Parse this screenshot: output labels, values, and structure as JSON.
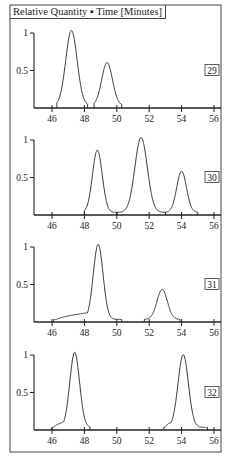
{
  "header": {
    "title": "Relative Quantity ▪ Time [Minutes]"
  },
  "chart_data": [
    {
      "type": "line",
      "title": "Relative Quantity vs Time [Minutes]",
      "panel_label": "29",
      "xlabel": "Time [Minutes]",
      "ylabel": "Relative Quantity",
      "xlim": [
        45,
        56.2
      ],
      "ylim": [
        0,
        1
      ],
      "xticks": [
        46,
        48,
        50,
        52,
        54,
        56
      ],
      "yticks": [
        0.5,
        1
      ],
      "grid": false,
      "peaks": [
        {
          "center": 47.2,
          "height": 1.0,
          "width": 0.35,
          "start": 46.3,
          "end": 48.2
        },
        {
          "center": 49.4,
          "height": 0.57,
          "width": 0.33,
          "start": 48.6,
          "end": 50.3
        }
      ]
    },
    {
      "type": "line",
      "title": "Relative Quantity vs Time [Minutes]",
      "panel_label": "30",
      "xlabel": "Time [Minutes]",
      "ylabel": "Relative Quantity",
      "xlim": [
        45,
        56.2
      ],
      "ylim": [
        0,
        1
      ],
      "xticks": [
        46,
        48,
        50,
        52,
        54,
        56
      ],
      "yticks": [
        0.5,
        1
      ],
      "grid": false,
      "peaks": [
        {
          "center": 48.8,
          "height": 0.83,
          "width": 0.3,
          "start": 48.0,
          "end": 50.0
        },
        {
          "center": 51.5,
          "height": 1.0,
          "width": 0.38,
          "start": 50.0,
          "end": 53.0
        },
        {
          "center": 54.0,
          "height": 0.55,
          "width": 0.3,
          "start": 53.0,
          "end": 55.0
        }
      ],
      "baseline_markers": [
        48.0,
        50.0,
        53.0
      ]
    },
    {
      "type": "line",
      "title": "Relative Quantity vs Time [Minutes]",
      "panel_label": "31",
      "xlabel": "Time [Minutes]",
      "ylabel": "Relative Quantity",
      "xlim": [
        45,
        56.2
      ],
      "ylim": [
        0,
        1
      ],
      "xticks": [
        46,
        48,
        50,
        52,
        54,
        56
      ],
      "yticks": [
        0.5,
        1
      ],
      "grid": false,
      "peaks": [
        {
          "center": 48.85,
          "height": 1.0,
          "width": 0.3,
          "start": 46.1,
          "end": 50.3,
          "shoulder": {
            "from": 46.1,
            "to": 48.1,
            "level": 0.12
          }
        },
        {
          "center": 52.8,
          "height": 0.4,
          "width": 0.32,
          "start": 51.7,
          "end": 53.9
        }
      ]
    },
    {
      "type": "line",
      "title": "Relative Quantity vs Time [Minutes]",
      "panel_label": "32",
      "xlabel": "Time [Minutes]",
      "ylabel": "Relative Quantity",
      "xlim": [
        45,
        56.2
      ],
      "ylim": [
        0,
        1
      ],
      "xticks": [
        46,
        48,
        50,
        52,
        54,
        56
      ],
      "yticks": [
        0.5,
        1
      ],
      "grid": false,
      "peaks": [
        {
          "center": 47.4,
          "height": 1.0,
          "width": 0.3,
          "start": 46.0,
          "end": 48.35,
          "shoulder": {
            "from": 46.0,
            "to": 46.9,
            "level": 0.12
          }
        },
        {
          "center": 54.1,
          "height": 0.97,
          "width": 0.32,
          "start": 52.9,
          "end": 55.6,
          "shoulder": {
            "from": 52.9,
            "to": 53.5,
            "level": 0.12
          }
        }
      ]
    }
  ]
}
